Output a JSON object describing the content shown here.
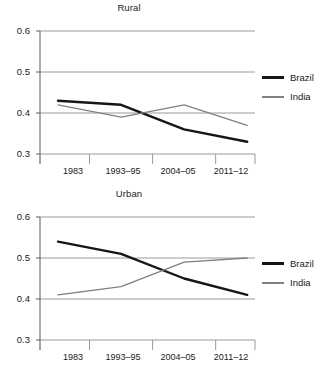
{
  "chart_data": [
    {
      "type": "line",
      "title": "Rural",
      "xlabel": "",
      "ylabel": "",
      "categories": [
        "1983",
        "1993–95",
        "2004–05",
        "2011–12"
      ],
      "ylim": [
        0.3,
        0.6
      ],
      "yticks": [
        "0.6",
        "0.5",
        "0.4",
        "0.3"
      ],
      "ytick_values": [
        0.6,
        0.5,
        0.4,
        0.3
      ],
      "grid": true,
      "legend_position": "right",
      "series": [
        {
          "name": "Brazil",
          "color": "#161616",
          "values": [
            0.43,
            0.42,
            0.36,
            0.33
          ]
        },
        {
          "name": "India",
          "color": "#808080",
          "values": [
            0.42,
            0.39,
            0.42,
            0.37
          ]
        }
      ]
    },
    {
      "type": "line",
      "title": "Urban",
      "xlabel": "",
      "ylabel": "",
      "categories": [
        "1983",
        "1993–95",
        "2004–05",
        "2011–12"
      ],
      "ylim": [
        0.3,
        0.6
      ],
      "yticks": [
        "0.6",
        "0.5",
        "0.4",
        "0.3"
      ],
      "ytick_values": [
        0.6,
        0.5,
        0.4,
        0.3
      ],
      "grid": true,
      "legend_position": "right",
      "series": [
        {
          "name": "Brazil",
          "color": "#161616",
          "values": [
            0.54,
            0.51,
            0.45,
            0.41
          ]
        },
        {
          "name": "India",
          "color": "#808080",
          "values": [
            0.41,
            0.43,
            0.49,
            0.5
          ]
        }
      ]
    }
  ],
  "panels": {
    "rural": {
      "title": "Rural",
      "yticks": [
        "0.6",
        "0.5",
        "0.4",
        "0.3"
      ],
      "xticks": [
        "1983",
        "1993–95",
        "2004–05",
        "2011–12"
      ],
      "legend": [
        {
          "label": "Brazil"
        },
        {
          "label": "India"
        }
      ]
    },
    "urban": {
      "title": "Urban",
      "yticks": [
        "0.6",
        "0.5",
        "0.4",
        "0.3"
      ],
      "xticks": [
        "1983",
        "1993–95",
        "2004–05",
        "2011–12"
      ],
      "legend": [
        {
          "label": "Brazil"
        },
        {
          "label": "India"
        }
      ]
    }
  }
}
